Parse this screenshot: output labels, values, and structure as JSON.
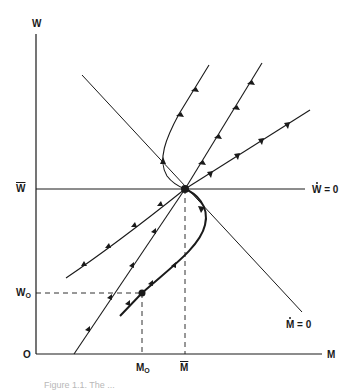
{
  "diagram": {
    "axes": {
      "y_label": "W",
      "x_label": "M",
      "origin_label": "O"
    },
    "levels": {
      "w_bar_label": "W",
      "w0_label": "W",
      "w0_sub": "O",
      "m0_label": "M",
      "m0_sub": "O",
      "m_bar_label": "M"
    },
    "isoclines": {
      "w_dot_label_var": "W",
      "w_dot_label_eq": " = 0",
      "m_dot_label_var": "M",
      "m_dot_label_eq": " = 0"
    },
    "caption": "Figure 1.1. The ..."
  }
}
